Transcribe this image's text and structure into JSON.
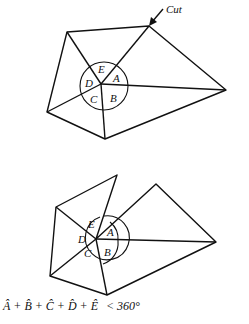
{
  "top_diagram": {
    "cut_label": "Cut",
    "angle_labels": {
      "A": "A",
      "B": "B",
      "C": "C",
      "D": "D",
      "E": "E"
    },
    "center": [
      101,
      84
    ],
    "vertices": {
      "top": [
        149,
        26
      ],
      "top_left": [
        67,
        32
      ],
      "left": [
        47,
        112
      ],
      "bottom": [
        105,
        139
      ],
      "right": [
        226,
        90
      ]
    }
  },
  "bottom_diagram": {
    "angle_labels": {
      "A": "A",
      "B": "B",
      "C": "C",
      "D": "D",
      "E": "E"
    },
    "center": [
      96,
      239
    ],
    "vertices": {
      "cut_left_piece": [
        117,
        175
      ],
      "cut_right_piece": [
        156,
        184
      ],
      "top_left": [
        56,
        207
      ],
      "left": [
        50,
        276
      ],
      "bottom": [
        107,
        295
      ],
      "right": [
        216,
        242
      ]
    }
  },
  "caption": {
    "sum_expression": "Â + B̂ + Ĉ + D̂ + Ê",
    "relation": "< 360°"
  }
}
